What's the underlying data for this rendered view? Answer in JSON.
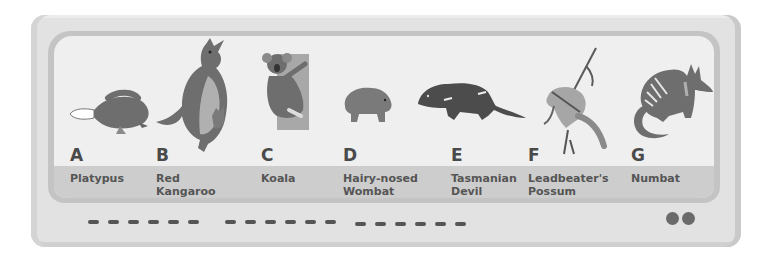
{
  "panel": {
    "animals": [
      {
        "letter": "A",
        "name_line1": "Platypus",
        "name_line2": ""
      },
      {
        "letter": "B",
        "name_line1": "Red",
        "name_line2": "Kangaroo"
      },
      {
        "letter": "C",
        "name_line1": "Koala",
        "name_line2": ""
      },
      {
        "letter": "D",
        "name_line1": "Hairy-nosed",
        "name_line2": "Wombat"
      },
      {
        "letter": "E",
        "name_line1": "Tasmanian",
        "name_line2": "Devil"
      },
      {
        "letter": "F",
        "name_line1": "Leadbeater's",
        "name_line2": "Possum"
      },
      {
        "letter": "G",
        "name_line1": "Numbat",
        "name_line2": ""
      }
    ]
  },
  "bottom_bar": {
    "dash_groups": 3,
    "dashes_per_group": 6,
    "indicator_dots": 2
  },
  "colors": {
    "device_body": "#e2e2e2",
    "screen_frame": "#c4c4c4",
    "screen": "#efefef",
    "label_band": "#cdcdcd",
    "animal_fill": "#6e6e6e",
    "text": "#4a4a4a"
  }
}
